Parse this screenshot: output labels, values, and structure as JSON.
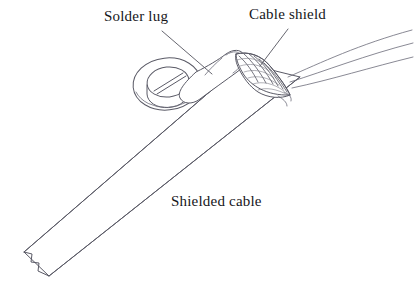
{
  "diagram": {
    "background_color": "#ffffff",
    "line_color": "#5a5a66",
    "text_color": "#16161a",
    "width": 414,
    "height": 282,
    "style": "technical line drawing",
    "labels": [
      {
        "id": "solder-lug",
        "text": "Solder lug",
        "x": 104,
        "y": 9,
        "leader": "line from label down-right to the lug tab"
      },
      {
        "id": "cable-shield",
        "text": "Cable shield",
        "x": 249,
        "y": 7,
        "leader": "line from label down-left to the braided shield band"
      },
      {
        "id": "shielded-cable",
        "text": "Shielded cable",
        "x": 171,
        "y": 194,
        "leader": "none"
      }
    ],
    "parts": [
      {
        "name": "solder-lug-ring",
        "description": "elliptical ring terminal seen in perspective with a slotted screw head in the centre"
      },
      {
        "name": "solder-lug-tab",
        "description": "flat neck of the lug running from the ring up-right and wrapping over the cable"
      },
      {
        "name": "cable-shield-braid",
        "description": "fan shaped braided shield band with cross hatched weave texture, folded back over the lug neck"
      },
      {
        "name": "shielded-cable-body",
        "description": "long tapered cable jacket running from lower left to upper right"
      },
      {
        "name": "cable-break",
        "description": "zigzag break line at the lower left end showing the cable continues"
      }
    ]
  }
}
